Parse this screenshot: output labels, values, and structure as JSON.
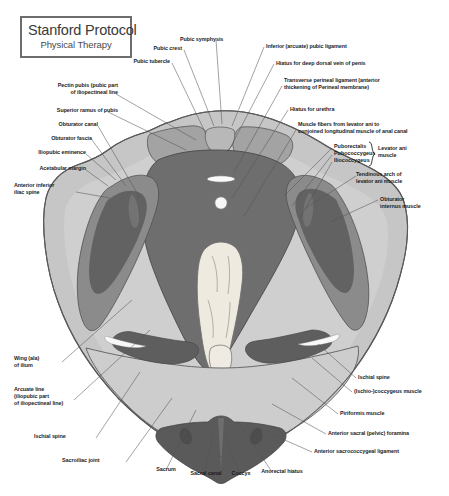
{
  "title_box": {
    "main": "Stanford Protocol",
    "sub": "Physical Therapy"
  },
  "figure": {
    "palette": {
      "background": "#ffffff",
      "outer_bone_light": "#c9c9c9",
      "bone_mid": "#b4b4b4",
      "muscle_mid_gray": "#8f8f8f",
      "muscle_dark_gray": "#6f6f6f",
      "muscle_darkest": "#585858",
      "sacrum_cream": "#eeeae0",
      "highlight_white": "#f6f6f6",
      "outline": "#4a4a4a",
      "leader_line": "#555555",
      "text": "#1c1c1c",
      "title_border": "#6d6d6d"
    }
  },
  "labels_left": [
    {
      "id": "pectin-pubis",
      "text": "Pectin pubis (pubic part\nof iliopectineal line"
    },
    {
      "id": "superior-ramus",
      "text": "Superior ramus of pubis"
    },
    {
      "id": "obturator-canal",
      "text": "Obturator canal"
    },
    {
      "id": "obturator-fascia",
      "text": "Obturator fascia"
    },
    {
      "id": "iliopubic-eminence",
      "text": "Iliopubic eminence"
    },
    {
      "id": "acetabular-margin",
      "text": "Acetabular margin"
    },
    {
      "id": "anterior-inferior-iliac-spine",
      "text": "Anterior inferior\niliac spine"
    },
    {
      "id": "wing-ala-of-ilium",
      "text": "Wing (ala)\nof ilium"
    },
    {
      "id": "arcuate-line",
      "text": "Arcuate line\n(iliopubic part\nof iliopectineal line)"
    },
    {
      "id": "ischial-spine-left",
      "text": "Ischial spine"
    },
    {
      "id": "sacroiliac-joint",
      "text": "Sacroiliac joint"
    }
  ],
  "labels_top": [
    {
      "id": "pubic-tubercle",
      "text": "Pubic tubercle"
    },
    {
      "id": "pubic-crest",
      "text": "Pubic crest"
    },
    {
      "id": "pubic-symphysis",
      "text": "Pubic symphysis"
    }
  ],
  "labels_right": [
    {
      "id": "inferior-arcuate-pubic-ligament",
      "text": "Inferior (arcuate) pubic ligament"
    },
    {
      "id": "hiatus-deep-dorsal-vein",
      "text": "Hiatus for deep dorsal vein of penis"
    },
    {
      "id": "transverse-perineal-ligament",
      "text": "Transverse perineal ligament (anterior\nthickening of Perineal membrane)"
    },
    {
      "id": "hiatus-for-urethra",
      "text": "Hiatus for urethra"
    },
    {
      "id": "muscle-fibers-levator-ani",
      "text": "Muscle fibers from levator ani to\nconjoined longitudinal muscle of anal canal"
    },
    {
      "id": "tendinous-arch-levator-ani",
      "text": "Tendinous arch of\nlevator ani muscle"
    },
    {
      "id": "obturator-internus-muscle",
      "text": "Obturator\ninternus muscle"
    },
    {
      "id": "ischial-spine-right",
      "text": "Ischial spine"
    },
    {
      "id": "ischio-coccygeus-muscle",
      "text": "(Ischio-)coccygeus muscle"
    },
    {
      "id": "piriformis-muscle",
      "text": "Piriformis muscle"
    },
    {
      "id": "anterior-sacral-foramina",
      "text": "Anterior sacral (pelvic) foramina"
    },
    {
      "id": "anterior-sacrococcygeal-ligament",
      "text": "Anterior sacrococcygeal ligament"
    }
  ],
  "levator_ani_group": {
    "items": [
      "Puborectalis",
      "Pubococcygeus",
      "Iliococcygeus"
    ],
    "group_label": "Levator ani\nmuscle"
  },
  "labels_bottom": [
    {
      "id": "sacrum",
      "text": "Sacrum"
    },
    {
      "id": "sacral-canal",
      "text": "Sacral canal"
    },
    {
      "id": "coccyx",
      "text": "Coccyx"
    },
    {
      "id": "anorectal-hiatus",
      "text": "Anorectal hiatus"
    }
  ]
}
